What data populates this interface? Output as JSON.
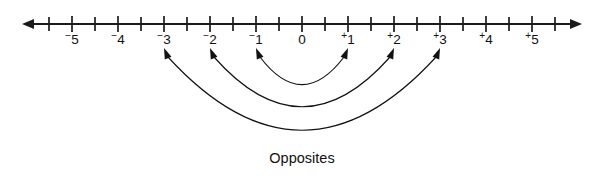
{
  "figure": {
    "background_color": "#ffffff",
    "line_color": "#1b1b1b",
    "arc_color": "#111111"
  },
  "number_line": {
    "origin_x": 302,
    "unit_px": 46,
    "axis_y": 24,
    "left_end_x": 22,
    "right_end_x": 582,
    "tick_top": 16,
    "tick_bottom": 32,
    "minor_tick_top": 17,
    "minor_tick_bottom": 31,
    "label_y": 44,
    "labels": [
      {
        "value": -5,
        "sign": "⁻",
        "digit": "5",
        "text": "⁻5"
      },
      {
        "value": -4,
        "sign": "⁻",
        "digit": "4",
        "text": "⁻4"
      },
      {
        "value": -3,
        "sign": "⁻",
        "digit": "3",
        "text": "⁻3"
      },
      {
        "value": -2,
        "sign": "⁻",
        "digit": "2",
        "text": "⁻2"
      },
      {
        "value": -1,
        "sign": "⁻",
        "digit": "1",
        "text": "⁻1"
      },
      {
        "value": 0,
        "sign": "",
        "digit": "0",
        "text": "0"
      },
      {
        "value": 1,
        "sign": "⁺",
        "digit": "1",
        "text": "⁺1"
      },
      {
        "value": 2,
        "sign": "⁺",
        "digit": "2",
        "text": "⁺2"
      },
      {
        "value": 3,
        "sign": "⁺",
        "digit": "3",
        "text": "⁺3"
      },
      {
        "value": 4,
        "sign": "⁺",
        "digit": "4",
        "text": "⁺4"
      },
      {
        "value": 5,
        "sign": "⁺",
        "digit": "5",
        "text": "⁺5"
      }
    ],
    "major_tick_values": [
      -5,
      -4,
      -3,
      -2,
      -1,
      0,
      1,
      2,
      3,
      4,
      5
    ],
    "minor_tick_values": [
      -5.5,
      -4.5,
      -3.5,
      -2.5,
      -1.5,
      -0.5,
      0.5,
      1.5,
      2.5,
      3.5,
      4.5,
      5.5
    ],
    "arrow_left_label": "left-arrowhead",
    "arrow_right_label": "right-arrowhead"
  },
  "opposite_pairs": [
    {
      "id": "pair-1",
      "from": -1,
      "to": 1,
      "depth": 48,
      "label": "⁻1 and ⁺1"
    },
    {
      "id": "pair-2",
      "from": -2,
      "to": 2,
      "depth": 81,
      "label": "⁻2 and ⁺2"
    },
    {
      "id": "pair-3",
      "from": -3,
      "to": 3,
      "depth": 116,
      "label": "⁻3 and ⁺3"
    }
  ],
  "caption": {
    "text": "Opposites",
    "x": 302,
    "y": 163
  }
}
